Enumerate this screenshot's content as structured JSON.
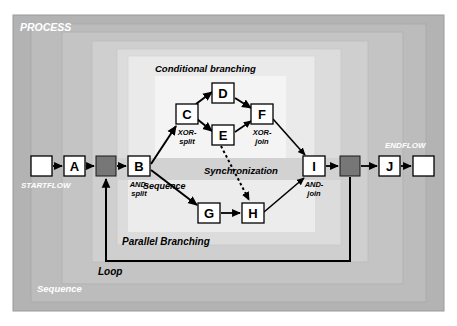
{
  "diagram": {
    "colors": {
      "outer_frame": "#b0b0b0",
      "zone_2": "#bdbdbd",
      "zone_3": "#c8c8c8",
      "zone_4": "#d7d7d7",
      "zone_5": "#e4e4e4",
      "zone_6": "#eeeeee",
      "zone_7": "#f6f6f6",
      "node_fill": "#ffffff",
      "node_stroke": "#000000",
      "gateway_fill": "#777777",
      "gateway_stroke": "#000000",
      "arrow": "#000000",
      "white_label": "#ffffff",
      "black_label": "#000000"
    },
    "zone_labels": [
      {
        "id": "process",
        "text": "PROCESS",
        "color": "white",
        "x": 20,
        "y": 28
      },
      {
        "id": "endflow",
        "text": "ENDFLOW",
        "color": "white",
        "x": 385,
        "y": 145
      },
      {
        "id": "startflow",
        "text": "STARTFLOW",
        "color": "white",
        "x": 21,
        "y": 185
      },
      {
        "id": "sequence-outer",
        "text": "Sequence",
        "color": "white",
        "x": 37,
        "y": 289
      }
    ],
    "region_labels": [
      {
        "id": "conditional-branching",
        "text": "Conditional branching",
        "x": 155,
        "y": 70
      },
      {
        "id": "synchronization",
        "text": "Synchronization",
        "x": 206,
        "y": 172
      },
      {
        "id": "parallel-branching",
        "text": "Parallel Branching",
        "x": 122,
        "y": 243
      },
      {
        "id": "loop",
        "text": "Loop",
        "x": 98,
        "y": 273
      },
      {
        "id": "sequence-inner",
        "text": "Sequence",
        "x": 142,
        "y": 187
      }
    ],
    "nodes": [
      {
        "id": "start",
        "label": "",
        "x": 31,
        "y": 156,
        "w": 21,
        "h": 20,
        "type": "terminal"
      },
      {
        "id": "A",
        "label": "A",
        "x": 64,
        "y": 156,
        "w": 21,
        "h": 20,
        "type": "activity"
      },
      {
        "id": "B",
        "label": "B",
        "x": 128,
        "y": 156,
        "w": 22,
        "h": 20,
        "type": "activity"
      },
      {
        "id": "C",
        "label": "C",
        "x": 176,
        "y": 104,
        "w": 22,
        "h": 20,
        "type": "activity"
      },
      {
        "id": "D",
        "label": "D",
        "x": 212,
        "y": 83,
        "w": 22,
        "h": 20,
        "type": "activity"
      },
      {
        "id": "E",
        "label": "E",
        "x": 212,
        "y": 125,
        "w": 22,
        "h": 20,
        "type": "activity"
      },
      {
        "id": "F",
        "label": "F",
        "x": 251,
        "y": 104,
        "w": 22,
        "h": 20,
        "type": "activity"
      },
      {
        "id": "G",
        "label": "G",
        "x": 198,
        "y": 203,
        "w": 22,
        "h": 20,
        "type": "activity"
      },
      {
        "id": "H",
        "label": "H",
        "x": 242,
        "y": 203,
        "w": 22,
        "h": 20,
        "type": "activity"
      },
      {
        "id": "I",
        "label": "I",
        "x": 303,
        "y": 156,
        "w": 22,
        "h": 20,
        "type": "activity"
      },
      {
        "id": "J",
        "label": "J",
        "x": 379,
        "y": 156,
        "w": 21,
        "h": 20,
        "type": "activity"
      },
      {
        "id": "end",
        "label": "",
        "x": 413,
        "y": 156,
        "w": 21,
        "h": 20,
        "type": "terminal"
      }
    ],
    "gateways": [
      {
        "id": "merge-left",
        "x": 96,
        "y": 156,
        "w": 20,
        "h": 20
      },
      {
        "id": "split-right",
        "x": 340,
        "y": 156,
        "w": 20,
        "h": 20
      }
    ],
    "node_annotations": [
      {
        "id": "b-and-split",
        "for": "B",
        "line1": "AND-",
        "line2": "split",
        "x": 139,
        "y": 186
      },
      {
        "id": "c-xor-split",
        "for": "C",
        "line1": "XOR-",
        "line2": "split",
        "x": 178,
        "y": 134
      },
      {
        "id": "f-xor-join",
        "for": "F",
        "line1": "XOR-",
        "line2": "join",
        "x": 252,
        "y": 134
      },
      {
        "id": "i-and-join",
        "for": "I",
        "line1": "AND-",
        "line2": "join",
        "x": 305,
        "y": 186
      }
    ],
    "edges": [
      {
        "id": "start-to-A",
        "from": "start",
        "to": "A",
        "style": "solid"
      },
      {
        "id": "A-to-merge",
        "from": "A",
        "to": "merge-left",
        "style": "solid"
      },
      {
        "id": "merge-to-B",
        "from": "merge-left",
        "to": "B",
        "style": "solid"
      },
      {
        "id": "B-to-C",
        "from": "B",
        "to": "C",
        "style": "solid"
      },
      {
        "id": "B-to-G",
        "from": "B",
        "to": "G",
        "style": "solid"
      },
      {
        "id": "C-to-D",
        "from": "C",
        "to": "D",
        "style": "solid"
      },
      {
        "id": "C-to-E",
        "from": "C",
        "to": "E",
        "style": "solid"
      },
      {
        "id": "D-to-F",
        "from": "D",
        "to": "F",
        "style": "solid"
      },
      {
        "id": "E-to-F",
        "from": "E",
        "to": "F",
        "style": "solid"
      },
      {
        "id": "F-to-I",
        "from": "F",
        "to": "I",
        "style": "solid"
      },
      {
        "id": "E-to-H-sync",
        "from": "E",
        "to": "H",
        "style": "dotted"
      },
      {
        "id": "G-to-H",
        "from": "G",
        "to": "H",
        "style": "solid"
      },
      {
        "id": "H-to-I",
        "from": "H",
        "to": "I",
        "style": "solid"
      },
      {
        "id": "I-to-split",
        "from": "I",
        "to": "split-right",
        "style": "solid"
      },
      {
        "id": "split-to-J",
        "from": "split-right",
        "to": "J",
        "style": "solid"
      },
      {
        "id": "J-to-end",
        "from": "J",
        "to": "end",
        "style": "solid"
      },
      {
        "id": "loop-back",
        "from": "split-right",
        "to": "merge-left",
        "style": "solid"
      }
    ]
  }
}
